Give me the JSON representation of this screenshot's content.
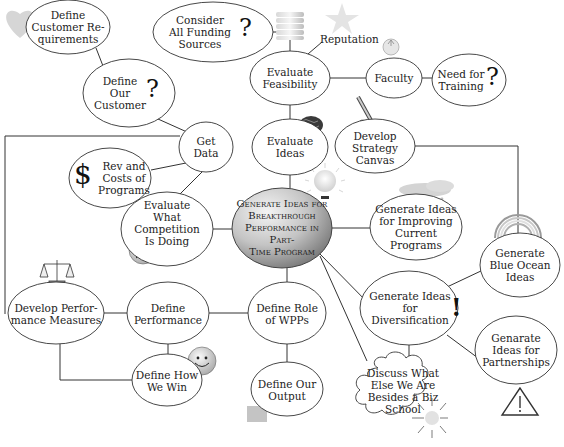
{
  "colors": {
    "line": "#333333",
    "node_fill": "#ffffff",
    "node_stroke": "#333333",
    "center_fill_light": "#f2f2f2",
    "center_fill_dark": "#8f8f8f",
    "icon_gray": "#c8c8c8"
  },
  "nodes": {
    "center": {
      "label": "Generate Ideas for\nBreakthrough\nPerformance in Part-\nTime Program"
    },
    "define_customer_requirements": {
      "label": "Define\nCustomer Re-\nquirements",
      "icon": "heart-icon"
    },
    "consider_all_funding_sources": {
      "label": "Consider\nAll Funding\nSources",
      "glyph": "?"
    },
    "define_our_customer": {
      "label": "Define\nOur\nCustomer",
      "glyph": "?"
    },
    "evaluate_feasibility": {
      "label": "Evaluate\nFeasibility",
      "icon": "coin-stack-icon"
    },
    "reputation": {
      "label": "Reputation",
      "icon": "star-icon"
    },
    "faculty": {
      "label": "Faculty",
      "icon": "apple-icon"
    },
    "need_for_training": {
      "label": "Need for\nTraining",
      "glyph": "?"
    },
    "get_data": {
      "label": "Get\nData"
    },
    "evaluate_ideas": {
      "label": "Evaluate\nIdeas",
      "icon": "brain-icon"
    },
    "develop_strategy_canvas": {
      "label": "Develop\nStrategy\nCanvas",
      "icon": "pencil-icon"
    },
    "rev_and_costs": {
      "label": "Rev and\nCosts of\nPrograms",
      "glyph": "$"
    },
    "evaluate_competition": {
      "label": "Evaluate\nWhat Competition\nIs Doing",
      "icon": "sad-face-icon"
    },
    "generate_ideas_improving": {
      "label": "Generate Ideas\nfor Improving\nCurrent Programs",
      "icon": "rain-cloud-icon"
    },
    "generate_blue_ocean": {
      "label": "Generate\nBlue Ocean\nIdeas",
      "icon": "rainbow-icon"
    },
    "generate_ideas_diversification": {
      "label": "Generate Ideas\nfor Diversification",
      "glyph": "!"
    },
    "genarate_partnerships": {
      "label": "Genarate\nIdeas for\nPartnerships",
      "icon": "warning-triangle-icon"
    },
    "discuss_what_else": {
      "label": "Discuss What\nElse We Are\nBesides a Biz\nSchool",
      "icon": "sun-icon"
    },
    "develop_performance_measures": {
      "label": "Develop Perfor-\nmance Measures",
      "icon": "scales-icon"
    },
    "define_performance": {
      "label": "Define\nPerformance"
    },
    "define_role_wpps": {
      "label": "Define Role\nof WPPs"
    },
    "define_how_we_win": {
      "label": "Define How\nWe Win",
      "icon": "smiley-face-icon"
    },
    "define_our_output": {
      "label": "Define Our\nOutput",
      "icon": "document-icon"
    },
    "lightbulb": {
      "icon": "lightbulb-icon"
    }
  }
}
